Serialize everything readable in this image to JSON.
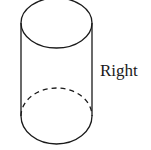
{
  "diagram": {
    "shape": "right circular cylinder",
    "label": "Right",
    "stroke_color": "#1a1a1a",
    "background": "#ffffff"
  }
}
